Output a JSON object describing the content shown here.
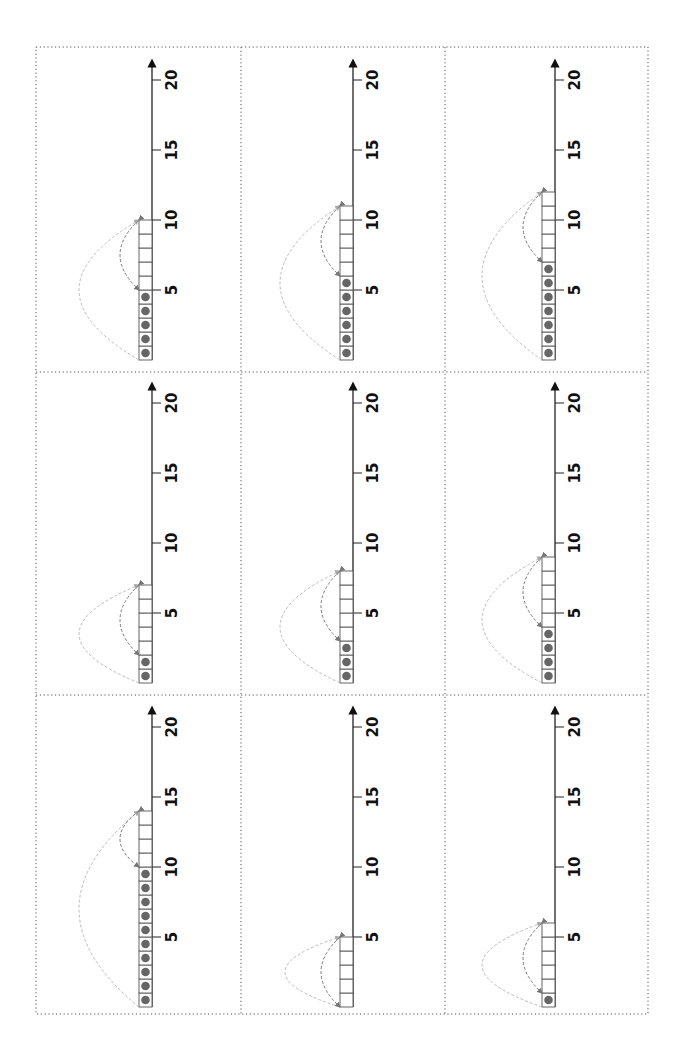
{
  "worksheet": {
    "title": "",
    "orientation": "rotated-90",
    "axis": {
      "min": 0,
      "max": 20,
      "tick_labels": [
        "5",
        "10",
        "15",
        "20"
      ],
      "tick_values": [
        5,
        10,
        15,
        20
      ]
    },
    "colors": {
      "border": "#555555",
      "axis": "#222222",
      "cell_border": "#555555",
      "dot": "#666666",
      "arc_outer": "#bbbbbb",
      "arc_inner": "#777777"
    },
    "panels": [
      {
        "row": 0,
        "col": 0,
        "dots": 5,
        "cells": 10
      },
      {
        "row": 0,
        "col": 1,
        "dots": 6,
        "cells": 11
      },
      {
        "row": 0,
        "col": 2,
        "dots": 7,
        "cells": 12
      },
      {
        "row": 1,
        "col": 0,
        "dots": 2,
        "cells": 7
      },
      {
        "row": 1,
        "col": 1,
        "dots": 3,
        "cells": 8
      },
      {
        "row": 1,
        "col": 2,
        "dots": 4,
        "cells": 9
      },
      {
        "row": 2,
        "col": 0,
        "dots": 10,
        "cells": 14
      },
      {
        "row": 2,
        "col": 1,
        "dots": 0,
        "cells": 5
      },
      {
        "row": 2,
        "col": 2,
        "dots": 1,
        "cells": 6
      }
    ]
  }
}
